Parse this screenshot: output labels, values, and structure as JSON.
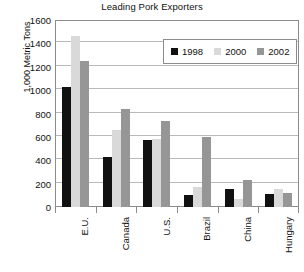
{
  "chart_data": {
    "type": "bar",
    "title": "Leading Pork Exporters",
    "xlabel": "",
    "ylabel": "1,000 Metric Tons",
    "ylim": [
      0,
      1600
    ],
    "ytick_step": 200,
    "yticks": [
      0,
      200,
      400,
      600,
      800,
      1000,
      1200,
      1400,
      1600
    ],
    "ytick_labels": [
      "0",
      "200",
      "400",
      "600",
      "800",
      "1000",
      "1200",
      "1400",
      "1600"
    ],
    "grid": true,
    "grid_axis": "y",
    "legend_position": "top-right-inside",
    "categories": [
      "E.U.",
      "Canada",
      "U.S.",
      "Brazil",
      "China",
      "Hungary"
    ],
    "series": [
      {
        "name": "1998",
        "color": "#111111",
        "values": [
          1030,
          430,
          570,
          105,
          150,
          115
        ]
      },
      {
        "name": "2000",
        "color": "#d9d9d9",
        "values": [
          1465,
          660,
          580,
          175,
          70,
          155
        ]
      },
      {
        "name": "2002",
        "color": "#969696",
        "values": [
          1250,
          840,
          735,
          600,
          230,
          120
        ]
      }
    ]
  },
  "axis": {
    "frame_color": "#8c8c8c",
    "grid_color": "#b9b9b9"
  }
}
